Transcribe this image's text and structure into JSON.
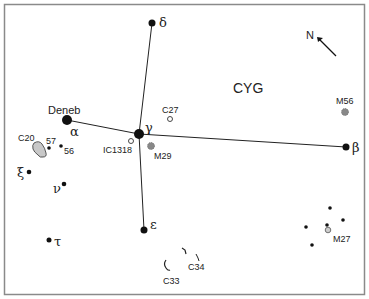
{
  "title": "CYG",
  "compass": {
    "label": "N"
  },
  "stars": {
    "alpha": {
      "greek": "α",
      "name": "Deneb"
    },
    "beta": {
      "greek": "β"
    },
    "gamma": {
      "greek": "γ"
    },
    "delta": {
      "greek": "δ"
    },
    "epsilon": {
      "greek": "ε"
    },
    "xi": {
      "greek": "ξ"
    },
    "nu": {
      "greek": "ν"
    },
    "tau": {
      "greek": "τ"
    },
    "s57": {
      "label": "57"
    },
    "s56": {
      "label": "56"
    }
  },
  "objects": {
    "c27": "C27",
    "ic1318": "IC1318",
    "m29": "M29",
    "m56": "M56",
    "c20": "C20",
    "c33": "C33",
    "c34": "C34",
    "m27": "M27"
  },
  "colors": {
    "ink": "#111111",
    "border": "#8a8a8a",
    "nebula": "#c8c8c8",
    "cluster": "#777777"
  }
}
